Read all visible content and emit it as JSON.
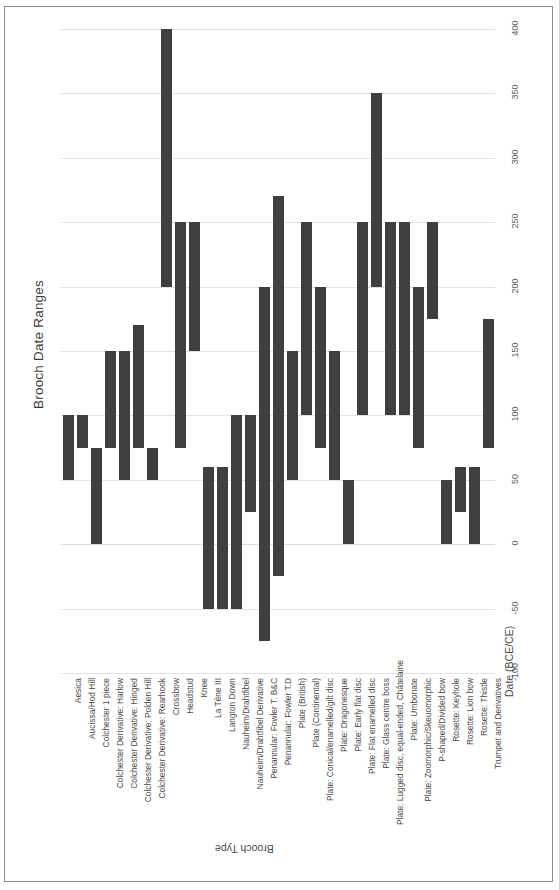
{
  "chart_data": {
    "type": "bar",
    "orientation": "vertical-floating-range",
    "title": "Brooch Date Ranges",
    "xlabel": "Brooch Type",
    "ylabel": "Date (BCE/CE)",
    "ylim": [
      -100,
      400
    ],
    "yticks": [
      -100,
      -50,
      0,
      50,
      100,
      150,
      200,
      250,
      300,
      350,
      400
    ],
    "ytick_labels": [
      "-100",
      "-50",
      "0",
      "50",
      "100",
      "150",
      "200",
      "250",
      "300",
      "350",
      "400"
    ],
    "grid": true,
    "legend": null,
    "bar_color": "#3f3f3f",
    "categories": [
      "Aesica",
      "Aucissa/Hod Hill",
      "Colchester 1 piece",
      "Colchester Derivative: Harlow",
      "Colchester Derivative: Hinged",
      "Colchester Derivative: Polden Hill",
      "Colchester Derivative: Rearhook",
      "Crossbow",
      "Headstud",
      "Knee",
      "La Tène III",
      "Langton Down",
      "Nauheim/Drahtfibel",
      "Nauheim/Drahtfibel Derivative",
      "Penannular: Fowler T. B&C",
      "Penannular: Fowler T.D",
      "Plate (British)",
      "Plate (Continental)",
      "Plate: Conical/enamelled/gilt disc",
      "Plate: Dragonesque",
      "Plate: Early flat disc",
      "Plate: Flat enamelled disc",
      "Plate: Glass centre boss",
      "Plate: Lugged disc, equal-ended, Châtelaine",
      "Plate: Umbonate",
      "Plate: Zoomorphic/Skeuomorphic",
      "P-shaped/Divided bow",
      "Rosette: Keyhole",
      "Rosette: Lion bow",
      "Rosette: Thistle",
      "Trumpet and Derivatives"
    ],
    "ranges": [
      {
        "category": "Aesica",
        "start": 50,
        "end": 100
      },
      {
        "category": "Aucissa/Hod Hill",
        "start": 75,
        "end": 100
      },
      {
        "category": "Colchester 1 piece",
        "start": 0,
        "end": 75
      },
      {
        "category": "Colchester Derivative: Harlow",
        "start": 75,
        "end": 150
      },
      {
        "category": "Colchester Derivative: Hinged",
        "start": 50,
        "end": 150
      },
      {
        "category": "Colchester Derivative: Polden Hill",
        "start": 75,
        "end": 170
      },
      {
        "category": "Colchester Derivative: Rearhook",
        "start": 50,
        "end": 75
      },
      {
        "category": "Crossbow",
        "start": 200,
        "end": 400
      },
      {
        "category": "Headstud",
        "start": 75,
        "end": 250
      },
      {
        "category": "Knee",
        "start": 150,
        "end": 250
      },
      {
        "category": "La Tène III",
        "start": -50,
        "end": 60
      },
      {
        "category": "Langton Down",
        "start": -50,
        "end": 60
      },
      {
        "category": "Nauheim/Drahtfibel",
        "start": -50,
        "end": 100
      },
      {
        "category": "Nauheim/Drahtfibel Derivative",
        "start": 25,
        "end": 100
      },
      {
        "category": "Penannular: Fowler T. B&C",
        "start": -75,
        "end": 200
      },
      {
        "category": "Penannular: Fowler T.D",
        "start": -25,
        "end": 270
      },
      {
        "category": "Plate (British)",
        "start": 50,
        "end": 150
      },
      {
        "category": "Plate (Continental)",
        "start": 100,
        "end": 250
      },
      {
        "category": "Plate: Conical/enamelled/gilt disc",
        "start": 75,
        "end": 200
      },
      {
        "category": "Plate: Dragonesque",
        "start": 50,
        "end": 150
      },
      {
        "category": "Plate: Early flat disc",
        "start": 0,
        "end": 50
      },
      {
        "category": "Plate: Flat enamelled disc",
        "start": 100,
        "end": 250
      },
      {
        "category": "Plate: Glass centre boss",
        "start": 200,
        "end": 350
      },
      {
        "category": "Plate: Lugged disc, equal-ended, Châtelaine",
        "start": 100,
        "end": 250
      },
      {
        "category": "Plate: Umbonate",
        "start": 100,
        "end": 250
      },
      {
        "category": "Plate: Zoomorphic/Skeuomorphic",
        "start": 75,
        "end": 200
      },
      {
        "category": "P-shaped/Divided bow",
        "start": 175,
        "end": 250
      },
      {
        "category": "Rosette: Keyhole",
        "start": 0,
        "end": 50
      },
      {
        "category": "Rosette: Lion bow",
        "start": 25,
        "end": 60
      },
      {
        "category": "Rosette: Thistle",
        "start": 0,
        "end": 60
      },
      {
        "category": "Trumpet and Derivatives",
        "start": 75,
        "end": 175
      }
    ]
  }
}
